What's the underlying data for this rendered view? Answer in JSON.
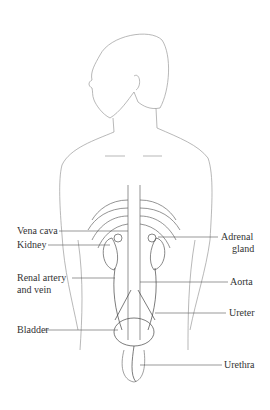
{
  "diagram": {
    "labels_left": [
      {
        "id": "vena-cava",
        "text": "Vena cava"
      },
      {
        "id": "kidney",
        "text": "Kidney"
      },
      {
        "id": "renal-artery-vein-1",
        "text": "Renal artery"
      },
      {
        "id": "renal-artery-vein-2",
        "text": "and vein"
      },
      {
        "id": "bladder",
        "text": "Bladder"
      }
    ],
    "labels_right": [
      {
        "id": "adrenal-1",
        "text": "Adrenal"
      },
      {
        "id": "adrenal-2",
        "text": "gland"
      },
      {
        "id": "aorta",
        "text": "Aorta"
      },
      {
        "id": "ureter",
        "text": "Ureter"
      },
      {
        "id": "urethra",
        "text": "Urethra"
      }
    ]
  }
}
